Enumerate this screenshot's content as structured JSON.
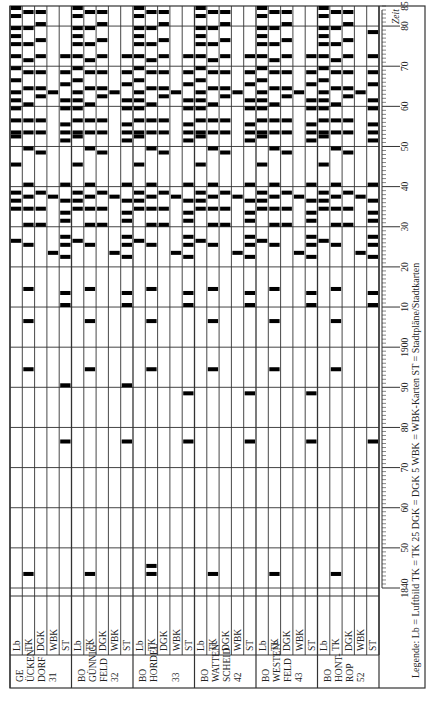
{
  "figure": {
    "orientation": "rotated-90-ccw",
    "axis_label": "Zeit",
    "legend": {
      "prefix": "Legende:",
      "items": [
        {
          "code": "Lb",
          "meaning": "Luftbild"
        },
        {
          "code": "TK",
          "meaning": "TK 25"
        },
        {
          "code": "DGK",
          "meaning": "DGK 5"
        },
        {
          "code": "WBK",
          "meaning": "WBK-Karten"
        },
        {
          "code": "ST",
          "meaning": "Stadtpläne/Stadtkarten"
        }
      ],
      "text": "Legende:  Lb = Luftbild    TK = TK 25    DGK = DGK 5    WBK = WBK-Karten    ST = Stadtpläne/Stadtkarten"
    },
    "time_ticks": [
      "1840",
      "50",
      "60",
      "70",
      "80",
      "90",
      "1900",
      "10",
      "20",
      "30",
      "40",
      "50",
      "60",
      "70",
      "80",
      "85"
    ],
    "colors": {
      "bar": "#000000",
      "grid": "#333333",
      "background": "#ffffff"
    }
  },
  "chart_data": {
    "type": "heatmap",
    "title": "",
    "xlabel": "Zeit",
    "ylabel": "",
    "xlim": [
      1840,
      1985
    ],
    "grid": true,
    "row_types": [
      "Lb",
      "TK",
      "DGK",
      "WBK",
      "ST"
    ],
    "groups": [
      {
        "name": "GE ÜCKENDORF 31",
        "label_lines": [
          "GE",
          "ÜCKEN-",
          "DORF",
          "31"
        ],
        "series": {
          "Lb": [
            1926,
            1934,
            1936,
            1938,
            1945,
            1952,
            1953,
            1956,
            1959,
            1961,
            1963,
            1966,
            1969,
            1972,
            1975,
            1977,
            1979,
            1982,
            1984
          ],
          "TK": [
            1843,
            1894,
            1906,
            1914,
            1925,
            1930,
            1934,
            1937,
            1940,
            1949,
            1953,
            1956,
            1960,
            1964,
            1968,
            1971,
            1975,
            1979,
            1983
          ],
          "DGK": [
            1930,
            1934,
            1938,
            1948,
            1953,
            1956,
            1962,
            1964,
            1968,
            1972,
            1976,
            1980,
            1983
          ],
          "WBK": [
            1923,
            1937,
            1963
          ],
          "ST": [
            1876,
            1890,
            1910,
            1913,
            1922,
            1925,
            1927,
            1931,
            1933,
            1936,
            1940,
            1951,
            1953,
            1955,
            1959,
            1961,
            1965,
            1968,
            1972
          ]
        }
      },
      {
        "name": "BO GÜNNIGFELD 32",
        "label_lines": [
          "BO",
          "GÜNNIG-",
          "FELD",
          "32"
        ],
        "series": {
          "Lb": [
            1926,
            1934,
            1936,
            1938,
            1945,
            1952,
            1953,
            1956,
            1959,
            1961,
            1963,
            1966,
            1969,
            1972,
            1975,
            1977,
            1979,
            1982,
            1984
          ],
          "TK": [
            1843,
            1894,
            1906,
            1914,
            1925,
            1930,
            1934,
            1937,
            1940,
            1949,
            1953,
            1956,
            1960,
            1964,
            1968,
            1971,
            1975,
            1979,
            1983
          ],
          "DGK": [
            1930,
            1934,
            1938,
            1948,
            1953,
            1956,
            1962,
            1964,
            1968,
            1972,
            1976,
            1980,
            1983
          ],
          "WBK": [
            1923,
            1937,
            1963
          ],
          "ST": [
            1876,
            1890,
            1910,
            1913,
            1922,
            1925,
            1927,
            1931,
            1933,
            1936,
            1940,
            1951,
            1953,
            1955,
            1959,
            1961,
            1965,
            1968,
            1972
          ]
        }
      },
      {
        "name": "BO HORDEL 33",
        "label_lines": [
          "BO",
          "HORDEL",
          "",
          "33"
        ],
        "series": {
          "Lb": [
            1926,
            1934,
            1936,
            1938,
            1945,
            1952,
            1953,
            1956,
            1959,
            1961,
            1963,
            1966,
            1969,
            1972,
            1975,
            1977,
            1979,
            1982,
            1984
          ],
          "TK": [
            1843,
            1845,
            1894,
            1906,
            1914,
            1925,
            1930,
            1934,
            1937,
            1940,
            1949,
            1953,
            1956,
            1960,
            1964,
            1968,
            1971,
            1975,
            1979,
            1983
          ],
          "DGK": [
            1930,
            1934,
            1938,
            1948,
            1953,
            1956,
            1962,
            1964,
            1968,
            1972,
            1976,
            1980,
            1983
          ],
          "WBK": [
            1923,
            1937,
            1963
          ],
          "ST": [
            1876,
            1888,
            1910,
            1913,
            1922,
            1925,
            1927,
            1931,
            1933,
            1936,
            1940,
            1951,
            1953,
            1955,
            1959,
            1961,
            1965,
            1968,
            1972
          ]
        }
      },
      {
        "name": "BO WATTENSCHEID 42",
        "label_lines": [
          "BO",
          "WATTEN-",
          "SCHEID",
          "42"
        ],
        "series": {
          "Lb": [
            1926,
            1934,
            1936,
            1938,
            1945,
            1952,
            1953,
            1956,
            1959,
            1961,
            1963,
            1966,
            1969,
            1972,
            1975,
            1977,
            1979,
            1982,
            1984
          ],
          "TK": [
            1843,
            1894,
            1906,
            1914,
            1925,
            1930,
            1934,
            1937,
            1940,
            1949,
            1953,
            1956,
            1960,
            1964,
            1968,
            1971,
            1975,
            1979,
            1983
          ],
          "DGK": [
            1930,
            1934,
            1938,
            1948,
            1953,
            1956,
            1962,
            1964,
            1968,
            1972,
            1976,
            1980,
            1983
          ],
          "WBK": [
            1923,
            1937,
            1963
          ],
          "ST": [
            1876,
            1888,
            1910,
            1913,
            1922,
            1925,
            1927,
            1931,
            1933,
            1936,
            1940,
            1951,
            1953,
            1955,
            1959,
            1961,
            1965,
            1968,
            1972
          ]
        }
      },
      {
        "name": "BO WESTENFELD 43",
        "label_lines": [
          "BO",
          "WESTEN-",
          "FELD",
          "43"
        ],
        "series": {
          "Lb": [
            1926,
            1934,
            1936,
            1938,
            1945,
            1952,
            1953,
            1956,
            1959,
            1961,
            1963,
            1966,
            1969,
            1972,
            1975,
            1977,
            1979,
            1982,
            1984
          ],
          "TK": [
            1843,
            1894,
            1906,
            1914,
            1925,
            1930,
            1934,
            1937,
            1940,
            1949,
            1953,
            1956,
            1960,
            1964,
            1968,
            1971,
            1975,
            1979,
            1983
          ],
          "DGK": [
            1930,
            1934,
            1938,
            1948,
            1953,
            1956,
            1962,
            1964,
            1968,
            1972,
            1976,
            1980,
            1983
          ],
          "WBK": [
            1923,
            1937,
            1963
          ],
          "ST": [
            1876,
            1888,
            1910,
            1913,
            1922,
            1925,
            1927,
            1931,
            1933,
            1936,
            1940,
            1951,
            1953,
            1955,
            1959,
            1961,
            1965,
            1968,
            1972
          ]
        }
      },
      {
        "name": "BO HONTROP 52",
        "label_lines": [
          "BO",
          "HONT-",
          "ROP",
          "52"
        ],
        "series": {
          "Lb": [
            1926,
            1934,
            1936,
            1938,
            1945,
            1952,
            1953,
            1956,
            1959,
            1961,
            1963,
            1966,
            1969,
            1972,
            1975,
            1977,
            1979,
            1982,
            1984
          ],
          "TK": [
            1843,
            1894,
            1906,
            1914,
            1925,
            1930,
            1934,
            1937,
            1940,
            1949,
            1953,
            1956,
            1960,
            1964,
            1968,
            1971,
            1975,
            1979,
            1983
          ],
          "DGK": [
            1930,
            1934,
            1938,
            1948,
            1953,
            1956,
            1962,
            1964,
            1968,
            1972,
            1976,
            1980,
            1983
          ],
          "WBK": [
            1923,
            1937,
            1963
          ],
          "ST": [
            1876,
            1910,
            1913,
            1922,
            1925,
            1927,
            1931,
            1933,
            1936,
            1940,
            1951,
            1953,
            1955,
            1959,
            1961,
            1965,
            1968,
            1972,
            1978
          ]
        }
      }
    ]
  }
}
